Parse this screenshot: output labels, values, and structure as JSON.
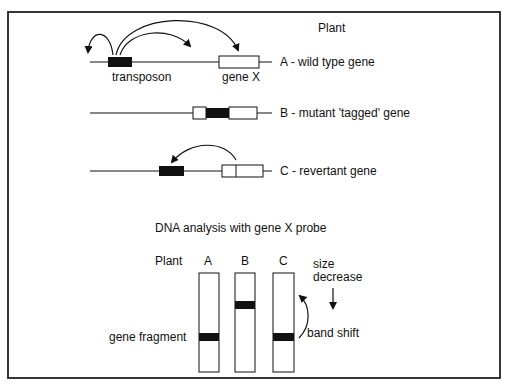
{
  "figure": {
    "header_label": "Plant",
    "rows": [
      {
        "id": "A",
        "label": "A - wild type gene",
        "sub_labels": [
          "transposon",
          "gene X"
        ]
      },
      {
        "id": "B",
        "label": "B - mutant 'tagged' gene"
      },
      {
        "id": "C",
        "label": "C - revertant gene"
      }
    ],
    "analysis_title": "DNA analysis with gene X probe",
    "gel": {
      "plant_label": "Plant",
      "lanes": [
        "A",
        "B",
        "C"
      ],
      "left_label": "gene fragment",
      "size_label_line1": "size",
      "size_label_line2": "decrease",
      "shift_label": "band shift"
    }
  },
  "colors": {
    "line": "#111111",
    "background": "#ffffff"
  }
}
